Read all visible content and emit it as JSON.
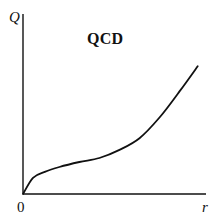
{
  "chart_data": {
    "type": "line",
    "title": "QCD",
    "xlabel": "r",
    "ylabel": "Q",
    "origin_label": "0",
    "x_ticks": [],
    "y_ticks": [],
    "grid": false,
    "legend": null,
    "xlim": [
      0,
      1
    ],
    "ylim": [
      0,
      1
    ],
    "series": [
      {
        "name": "QCD",
        "color": "#111111",
        "x": [
          0.0,
          0.055,
          0.12,
          0.2,
          0.31,
          0.42,
          0.53,
          0.64,
          0.75,
          0.86,
          0.96
        ],
        "y": [
          0.0,
          0.09,
          0.123,
          0.15,
          0.178,
          0.2,
          0.245,
          0.31,
          0.425,
          0.57,
          0.71
        ]
      }
    ]
  },
  "colors": {
    "axis": "#111111",
    "curve": "#111111",
    "background": "#ffffff"
  }
}
